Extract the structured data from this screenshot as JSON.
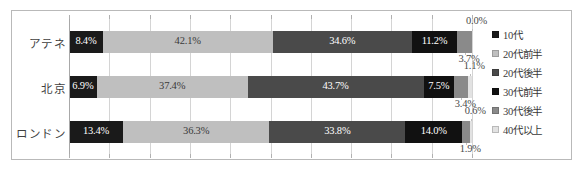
{
  "chart_data": {
    "type": "bar",
    "orientation": "horizontal",
    "stacked": true,
    "normalized_percent": true,
    "title": "",
    "subtitle": "",
    "xlabel": "",
    "ylabel": "",
    "xlim": [
      0,
      100
    ],
    "xtick_step": 10,
    "grid": true,
    "legend_position": "right",
    "categories": [
      "アテネ",
      "北京",
      "ロンドン"
    ],
    "series": [
      {
        "name": "10代",
        "color": "#1a1a1a",
        "values": [
          8.4,
          6.9,
          13.4
        ],
        "labels": [
          "8.4%",
          "6.9%",
          "13.4%"
        ]
      },
      {
        "name": "20代前半",
        "color": "#bfbfbf",
        "values": [
          42.1,
          37.4,
          36.3
        ],
        "labels": [
          "42.1%",
          "37.4%",
          "36.3%"
        ]
      },
      {
        "name": "20代後半",
        "color": "#4a4a4a",
        "values": [
          34.6,
          43.7,
          33.8
        ],
        "labels": [
          "34.6%",
          "43.7%",
          "33.8%"
        ]
      },
      {
        "name": "30代前半",
        "color": "#111111",
        "values": [
          11.2,
          7.5,
          14.0
        ],
        "labels": [
          "11.2%",
          "7.5%",
          "14.0%"
        ]
      },
      {
        "name": "30代後半",
        "color": "#8a8a8a",
        "values": [
          3.7,
          3.4,
          1.9
        ],
        "labels": [
          "3.7%",
          "3.4%",
          "1.9%"
        ]
      },
      {
        "name": "40代以上",
        "color": "#e2e2e2",
        "values": [
          0.0,
          1.1,
          0.6
        ],
        "labels": [
          "0.0%",
          "1.1%",
          "0.6%"
        ]
      }
    ]
  },
  "legend": {
    "items": [
      {
        "label": "10代"
      },
      {
        "label": "20代前半"
      },
      {
        "label": "20代後半"
      },
      {
        "label": "30代前半"
      },
      {
        "label": "30代後半"
      },
      {
        "label": "40代以上"
      }
    ]
  },
  "axis": {
    "ticks": [
      "0%",
      "10%",
      "20%",
      "30%",
      "40%",
      "50%",
      "60%",
      "70%",
      "80%",
      "90%",
      "100%"
    ]
  }
}
